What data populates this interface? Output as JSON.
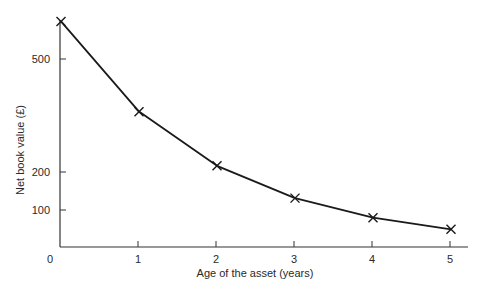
{
  "chart_data": {
    "type": "line",
    "title": "",
    "xlabel": "Age of the asset (years)",
    "ylabel": "Net book value (£)",
    "x": [
      0,
      1,
      2,
      3,
      4,
      5
    ],
    "x_tick_labels": [
      "0",
      "1",
      "2",
      "3",
      "4",
      "5"
    ],
    "y_ticks": [
      100,
      200,
      500
    ],
    "y_tick_labels": [
      "100",
      "200",
      "500"
    ],
    "xlim": [
      0,
      5.2
    ],
    "ylim": [
      0,
      600
    ],
    "grid": false,
    "legend": null,
    "marker": "x",
    "series": [
      {
        "name": "Net book value",
        "values": [
          600,
          360,
          216,
          130,
          78,
          47
        ],
        "color": "#1a1a1a"
      }
    ]
  },
  "labels": {
    "xlabel": "Age of the asset (years)",
    "ylabel": "Net book value (£)",
    "origin": "0",
    "x_ticks": [
      "1",
      "2",
      "3",
      "4",
      "5"
    ],
    "y_ticks": [
      "100",
      "200",
      "500"
    ]
  }
}
